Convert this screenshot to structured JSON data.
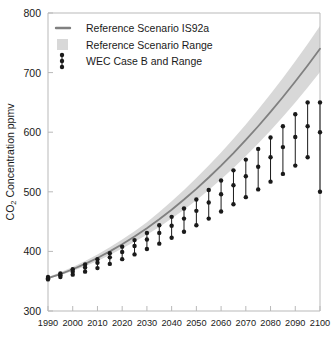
{
  "chart_data": {
    "type": "line",
    "title": "",
    "xlabel": "",
    "ylabel": "CO₂ Concentration ppmv",
    "xlim": [
      1990,
      2100
    ],
    "ylim": [
      300,
      800
    ],
    "xticks": [
      1990,
      2000,
      2010,
      2020,
      2030,
      2040,
      2050,
      2060,
      2070,
      2080,
      2090,
      2100
    ],
    "yticks": [
      300,
      400,
      500,
      600,
      700,
      800
    ],
    "grid": false,
    "legend_position": "top-left",
    "legend": [
      {
        "label": "Reference Scenario IS92a",
        "marker": "line",
        "color": "#808080"
      },
      {
        "label": "Reference Scenario Range",
        "marker": "band",
        "color": "#d8d8d8"
      },
      {
        "label": "WEC Case B and Range",
        "marker": "dots",
        "color": "#1a1a1a"
      }
    ],
    "series": [
      {
        "name": "Reference Scenario IS92a",
        "type": "line",
        "color": "#808080",
        "x": [
          1990,
          1995,
          2000,
          2005,
          2010,
          2015,
          2020,
          2025,
          2030,
          2035,
          2040,
          2045,
          2050,
          2055,
          2060,
          2065,
          2070,
          2075,
          2080,
          2085,
          2090,
          2095,
          2100
        ],
        "values": [
          355,
          362,
          370,
          379,
          389,
          400,
          412,
          425,
          439,
          454,
          470,
          487,
          505,
          524,
          544,
          565,
          587,
          610,
          634,
          659,
          685,
          712,
          740
        ]
      },
      {
        "name": "Reference Scenario Range upper",
        "type": "band-upper",
        "color": "#d8d8d8",
        "x": [
          1990,
          1995,
          2000,
          2005,
          2010,
          2015,
          2020,
          2025,
          2030,
          2035,
          2040,
          2045,
          2050,
          2055,
          2060,
          2065,
          2070,
          2075,
          2080,
          2085,
          2090,
          2095,
          2100
        ],
        "values": [
          357,
          365,
          374,
          384,
          395,
          407,
          420,
          434,
          449,
          466,
          484,
          503,
          523,
          544,
          566,
          589,
          613,
          638,
          664,
          691,
          719,
          748,
          778
        ]
      },
      {
        "name": "Reference Scenario Range lower",
        "type": "band-lower",
        "color": "#d8d8d8",
        "x": [
          1990,
          1995,
          2000,
          2005,
          2010,
          2015,
          2020,
          2025,
          2030,
          2035,
          2040,
          2045,
          2050,
          2055,
          2060,
          2065,
          2070,
          2075,
          2080,
          2085,
          2090,
          2095,
          2100
        ],
        "values": [
          354,
          360,
          367,
          375,
          384,
          394,
          405,
          416,
          428,
          441,
          455,
          470,
          486,
          503,
          521,
          540,
          560,
          581,
          603,
          626,
          650,
          675,
          701
        ]
      },
      {
        "name": "WEC Case B and Range",
        "type": "errorbar",
        "color": "#1a1a1a",
        "x": [
          1990,
          1995,
          2000,
          2005,
          2010,
          2015,
          2020,
          2025,
          2030,
          2035,
          2040,
          2045,
          2050,
          2055,
          2060,
          2065,
          2070,
          2075,
          2080,
          2085,
          2090,
          2095,
          2100
        ],
        "mid": [
          355,
          360,
          366,
          373,
          381,
          390,
          399,
          409,
          420,
          431,
          443,
          455,
          468,
          482,
          496,
          511,
          526,
          542,
          558,
          575,
          592,
          610,
          600
        ],
        "upper": [
          357,
          363,
          370,
          378,
          387,
          397,
          408,
          419,
          431,
          444,
          458,
          472,
          487,
          503,
          519,
          536,
          554,
          572,
          591,
          610,
          630,
          650,
          650
        ],
        "lower": [
          353,
          357,
          361,
          366,
          372,
          379,
          387,
          395,
          404,
          413,
          423,
          433,
          444,
          455,
          467,
          479,
          491,
          504,
          517,
          530,
          544,
          558,
          500
        ]
      }
    ]
  }
}
